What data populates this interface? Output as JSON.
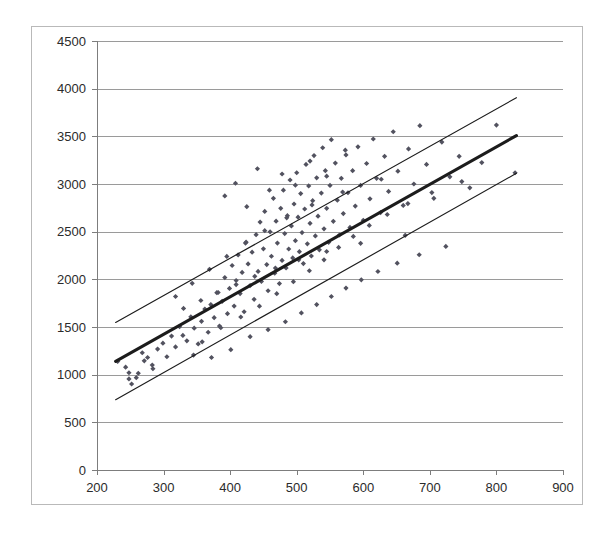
{
  "figure": {
    "background": "#ffffff",
    "frame_color": "#b9b9b9",
    "plot_area": {
      "left": 97,
      "top": 41,
      "right": 563,
      "bottom": 470
    }
  },
  "chart_data": {
    "type": "scatter",
    "title": "",
    "subtitle": "",
    "xlabel": "",
    "ylabel": "",
    "xlim": [
      200,
      900
    ],
    "ylim": [
      0,
      4500
    ],
    "xticks": [
      200,
      300,
      400,
      500,
      600,
      700,
      800,
      900
    ],
    "xtick_labels": [
      "200",
      "300",
      "400",
      "500",
      "600",
      "700",
      "800",
      "900"
    ],
    "yticks": [
      0,
      500,
      1000,
      1500,
      2000,
      2500,
      3000,
      3500,
      4000,
      4500
    ],
    "ytick_labels": [
      "0",
      "500",
      "1000",
      "1500",
      "2000",
      "2500",
      "3000",
      "3500",
      "4000",
      "4500"
    ],
    "grid": {
      "horizontal": true,
      "vertical": false,
      "color": "#9a9a9a"
    },
    "legend": {
      "visible": false,
      "position": "none"
    },
    "marker": {
      "shape": "diamond",
      "color": "#52525f",
      "size": 4
    },
    "series": [
      {
        "name": "observations",
        "type": "scatter",
        "points": [
          [
            231,
            1139
          ],
          [
            243,
            1079
          ],
          [
            248,
            955
          ],
          [
            252,
            902
          ],
          [
            262,
            1015
          ],
          [
            268,
            1230
          ],
          [
            276,
            1180
          ],
          [
            283,
            1101
          ],
          [
            291,
            1268
          ],
          [
            299,
            1330
          ],
          [
            305,
            1188
          ],
          [
            312,
            1405
          ],
          [
            318,
            1291
          ],
          [
            324,
            1503
          ],
          [
            329,
            1412
          ],
          [
            335,
            1355
          ],
          [
            341,
            1607
          ],
          [
            346,
            1488
          ],
          [
            352,
            1322
          ],
          [
            357,
            1560
          ],
          [
            362,
            1688
          ],
          [
            367,
            1445
          ],
          [
            371,
            1735
          ],
          [
            376,
            1598
          ],
          [
            380,
            1860
          ],
          [
            384,
            1510
          ],
          [
            388,
            1769
          ],
          [
            392,
            2018
          ],
          [
            396,
            1640
          ],
          [
            399,
            1905
          ],
          [
            403,
            2145
          ],
          [
            406,
            1720
          ],
          [
            409,
            1988
          ],
          [
            412,
            2256
          ],
          [
            415,
            1851
          ],
          [
            418,
            2072
          ],
          [
            421,
            1660
          ],
          [
            424,
            2390
          ],
          [
            427,
            2162
          ],
          [
            430,
            1935
          ],
          [
            433,
            2285
          ],
          [
            436,
            1790
          ],
          [
            439,
            2468
          ],
          [
            442,
            2083
          ],
          [
            445,
            2601
          ],
          [
            447,
            1978
          ],
          [
            450,
            2320
          ],
          [
            452,
            2712
          ],
          [
            455,
            2155
          ],
          [
            457,
            1880
          ],
          [
            460,
            2498
          ],
          [
            462,
            2242
          ],
          [
            465,
            2850
          ],
          [
            467,
            2065
          ],
          [
            469,
            2610
          ],
          [
            471,
            2380
          ],
          [
            474,
            1955
          ],
          [
            476,
            2745
          ],
          [
            478,
            2198
          ],
          [
            480,
            2935
          ],
          [
            482,
            2480
          ],
          [
            484,
            2120
          ],
          [
            486,
            2668
          ],
          [
            488,
            2318
          ],
          [
            490,
            3042
          ],
          [
            492,
            2560
          ],
          [
            494,
            2225
          ],
          [
            496,
            2790
          ],
          [
            498,
            2405
          ],
          [
            500,
            3118
          ],
          [
            502,
            2652
          ],
          [
            504,
            2290
          ],
          [
            506,
            2900
          ],
          [
            508,
            2490
          ],
          [
            510,
            2165
          ],
          [
            512,
            2738
          ],
          [
            514,
            3205
          ],
          [
            516,
            2372
          ],
          [
            518,
            2980
          ],
          [
            520,
            2588
          ],
          [
            522,
            2245
          ],
          [
            524,
            2825
          ],
          [
            526,
            3298
          ],
          [
            528,
            2455
          ],
          [
            530,
            3065
          ],
          [
            532,
            2662
          ],
          [
            534,
            2310
          ],
          [
            537,
            2905
          ],
          [
            539,
            3380
          ],
          [
            541,
            2530
          ],
          [
            543,
            3140
          ],
          [
            545,
            2745
          ],
          [
            548,
            2388
          ],
          [
            550,
            2985
          ],
          [
            552,
            3465
          ],
          [
            555,
            2608
          ],
          [
            558,
            3220
          ],
          [
            561,
            2830
          ],
          [
            564,
            2465
          ],
          [
            567,
            3060
          ],
          [
            570,
            2690
          ],
          [
            574,
            3305
          ],
          [
            577,
            2908
          ],
          [
            580,
            2545
          ],
          [
            584,
            3140
          ],
          [
            588,
            2768
          ],
          [
            592,
            3390
          ],
          [
            596,
            2985
          ],
          [
            600,
            2620
          ],
          [
            605,
            3215
          ],
          [
            610,
            2845
          ],
          [
            615,
            3472
          ],
          [
            620,
            3060
          ],
          [
            626,
            2700
          ],
          [
            632,
            3290
          ],
          [
            638,
            2922
          ],
          [
            645,
            3548
          ],
          [
            652,
            3135
          ],
          [
            660,
            2775
          ],
          [
            668,
            3368
          ],
          [
            676,
            3000
          ],
          [
            685,
            3612
          ],
          [
            695,
            3205
          ],
          [
            706,
            2850
          ],
          [
            718,
            3440
          ],
          [
            730,
            3075
          ],
          [
            744,
            3290
          ],
          [
            760,
            2960
          ],
          [
            778,
            3225
          ],
          [
            800,
            3618
          ],
          [
            828,
            3118
          ],
          [
            345,
            1206
          ],
          [
            358,
            1345
          ],
          [
            372,
            1180
          ],
          [
            386,
            1492
          ],
          [
            401,
            1262
          ],
          [
            416,
            1605
          ],
          [
            430,
            1398
          ],
          [
            444,
            1718
          ],
          [
            457,
            1472
          ],
          [
            470,
            1850
          ],
          [
            483,
            1555
          ],
          [
            495,
            1975
          ],
          [
            507,
            1648
          ],
          [
            519,
            2090
          ],
          [
            530,
            1735
          ],
          [
            541,
            2205
          ],
          [
            552,
            1820
          ],
          [
            563,
            2335
          ],
          [
            574,
            1908
          ],
          [
            585,
            2450
          ],
          [
            597,
            1995
          ],
          [
            609,
            2565
          ],
          [
            622,
            2082
          ],
          [
            636,
            2680
          ],
          [
            651,
            2170
          ],
          [
            667,
            2795
          ],
          [
            684,
            2258
          ],
          [
            703,
            2910
          ],
          [
            724,
            2345
          ],
          [
            748,
            3025
          ],
          [
            248,
            1020
          ],
          [
            259,
            968
          ],
          [
            271,
            1145
          ],
          [
            284,
            1062
          ],
          [
            392,
            2875
          ],
          [
            408,
            3008
          ],
          [
            425,
            2762
          ],
          [
            441,
            3160
          ],
          [
            459,
            2935
          ],
          [
            478,
            3105
          ],
          [
            498,
            2988
          ],
          [
            520,
            3240
          ],
          [
            545,
            3082
          ],
          [
            573,
            3355
          ],
          [
            318,
            1820
          ],
          [
            330,
            1695
          ],
          [
            343,
            1958
          ],
          [
            356,
            1778
          ],
          [
            369,
            2105
          ],
          [
            382,
            1862
          ],
          [
            395,
            2240
          ],
          [
            409,
            1945
          ],
          [
            423,
            2380
          ],
          [
            437,
            2032
          ],
          [
            452,
            2510
          ],
          [
            468,
            2118
          ],
          [
            485,
            2645
          ],
          [
            503,
            2205
          ],
          [
            523,
            2780
          ],
          [
            545,
            2292
          ],
          [
            569,
            2915
          ],
          [
            596,
            2378
          ],
          [
            627,
            3050
          ],
          [
            663,
            2462
          ]
        ]
      }
    ],
    "lines": [
      {
        "name": "upper-bound-line",
        "style": "thin",
        "x": [
          228,
          830
        ],
        "y": [
          1548,
          3905
        ],
        "color": "#1c1c1c"
      },
      {
        "name": "regression-line",
        "style": "thick",
        "x": [
          228,
          830
        ],
        "y": [
          1140,
          3508
        ],
        "color": "#1c1c1c"
      },
      {
        "name": "lower-bound-line",
        "style": "thin",
        "x": [
          228,
          830
        ],
        "y": [
          738,
          3112
        ],
        "color": "#1c1c1c"
      }
    ]
  }
}
